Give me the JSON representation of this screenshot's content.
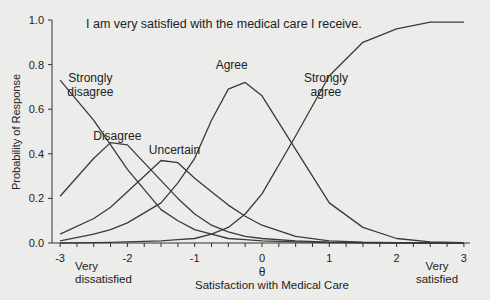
{
  "chart_data": {
    "type": "line",
    "title": "I am very satisfied with the medical care I receive.",
    "xlabel": "Satisfaction with Medical Care",
    "xsymbol": "θ",
    "ylabel": "Probability of Response",
    "xlim": [
      -3,
      3
    ],
    "ylim": [
      0,
      1.0
    ],
    "grid": false,
    "legend": "inline labels",
    "x_ticks": [
      "-3",
      "-2",
      "-1",
      "0",
      "1",
      "2",
      "3"
    ],
    "y_ticks": [
      "0.0",
      "0.2",
      "0.4",
      "0.6",
      "0.8",
      "1.0"
    ],
    "annotations": {
      "low_end": "Very dissatisfied",
      "high_end": "Very satisfied"
    },
    "x": [
      -3,
      -2.5,
      -2.25,
      -2,
      -1.5,
      -1.25,
      -1,
      -0.75,
      -0.5,
      -0.25,
      0,
      0.5,
      1,
      1.5,
      2,
      2.5,
      3
    ],
    "series": [
      {
        "name": "Strongly disagree",
        "values": [
          0.73,
          0.55,
          0.44,
          0.33,
          0.15,
          0.1,
          0.06,
          0.04,
          0.02,
          0.015,
          0.01,
          0.005,
          0.002,
          0.001,
          0,
          0,
          0
        ]
      },
      {
        "name": "Disagree",
        "values": [
          0.21,
          0.38,
          0.45,
          0.44,
          0.28,
          0.2,
          0.13,
          0.08,
          0.05,
          0.03,
          0.02,
          0.01,
          0.004,
          0.002,
          0.001,
          0,
          0
        ]
      },
      {
        "name": "Uncertain",
        "values": [
          0.04,
          0.11,
          0.16,
          0.23,
          0.37,
          0.36,
          0.29,
          0.23,
          0.17,
          0.12,
          0.08,
          0.03,
          0.01,
          0.004,
          0.002,
          0.001,
          0
        ]
      },
      {
        "name": "Agree",
        "values": [
          0.01,
          0.04,
          0.06,
          0.09,
          0.18,
          0.27,
          0.38,
          0.55,
          0.69,
          0.72,
          0.66,
          0.42,
          0.18,
          0.07,
          0.02,
          0.005,
          0.002
        ]
      },
      {
        "name": "Strongly agree",
        "values": [
          0,
          0.002,
          0.003,
          0.005,
          0.01,
          0.015,
          0.02,
          0.04,
          0.07,
          0.13,
          0.22,
          0.48,
          0.75,
          0.9,
          0.96,
          0.99,
          0.99
        ]
      }
    ],
    "label_positions": {
      "Strongly disagree": [
        -2.55,
        0.72
      ],
      "Disagree": [
        -2.15,
        0.46
      ],
      "Uncertain": [
        -1.3,
        0.4
      ],
      "Agree": [
        -0.45,
        0.78
      ],
      "Strongly agree": [
        0.95,
        0.72
      ]
    }
  }
}
